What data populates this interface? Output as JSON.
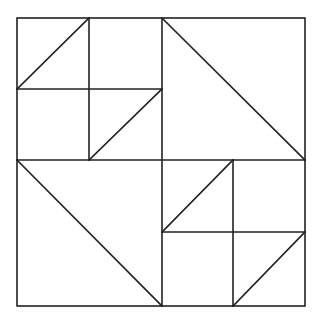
{
  "diagram": {
    "type": "geometric-tiling",
    "stroke_color": "#222222",
    "background_color": "#ffffff",
    "outer_square": {
      "x1": 17,
      "y1": 18,
      "x2": 305,
      "y2": 306
    },
    "center": {
      "x": 162,
      "y": 160
    },
    "quadrants": [
      {
        "name": "top-left",
        "subdivided": true,
        "grid_mid": {
          "x": 89,
          "y": 89
        },
        "diagonals": [
          {
            "from": [
              17,
              89
            ],
            "to": [
              89,
              18
            ]
          },
          {
            "from": [
              89,
              160
            ],
            "to": [
              162,
              89
            ]
          }
        ]
      },
      {
        "name": "top-right",
        "subdivided": false,
        "diagonals": [
          {
            "from": [
              162,
              18
            ],
            "to": [
              305,
              160
            ]
          }
        ]
      },
      {
        "name": "bottom-left",
        "subdivided": false,
        "diagonals": [
          {
            "from": [
              17,
              160
            ],
            "to": [
              162,
              306
            ]
          }
        ]
      },
      {
        "name": "bottom-right",
        "subdivided": true,
        "grid_mid": {
          "x": 233,
          "y": 232
        },
        "diagonals": [
          {
            "from": [
              162,
              232
            ],
            "to": [
              233,
              160
            ]
          },
          {
            "from": [
              233,
              306
            ],
            "to": [
              305,
              232
            ]
          }
        ]
      }
    ]
  }
}
